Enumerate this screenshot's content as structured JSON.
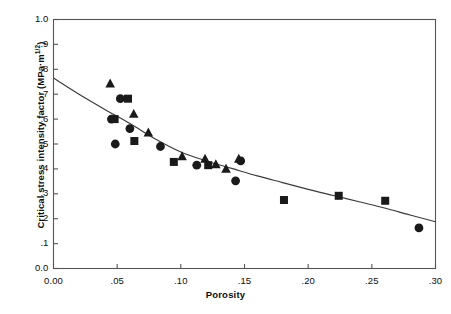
{
  "chart_data": {
    "type": "scatter",
    "title": "",
    "xlabel": "Porosity",
    "ylabel": "Critical stress intensity factor  (MPa·m",
    "ylabel_superscript": "1/2",
    "ylabel_close": ")",
    "xlim": [
      0.0,
      0.3
    ],
    "ylim": [
      0.0,
      1.0
    ],
    "grid": false,
    "legend": "none",
    "xticks": [
      0.0,
      0.05,
      0.1,
      0.15,
      0.2,
      0.25,
      0.3
    ],
    "xtick_labels": [
      "0.00",
      ".05",
      ".10",
      ".15",
      ".20",
      ".25",
      ".30"
    ],
    "yticks": [
      0.0,
      0.1,
      0.2,
      0.3,
      0.4,
      0.5,
      0.6,
      0.7,
      0.8,
      0.9,
      1.0
    ],
    "ytick_labels": [
      "0.0",
      ".1",
      ".2",
      ".3",
      ".4",
      ".5",
      ".6",
      ".7",
      ".8",
      ".9",
      "1.0"
    ],
    "marker_color": "#1a1a1a",
    "curve_color": "#3a3a3a",
    "axis_color": "#555555",
    "series": [
      {
        "name": "circle",
        "marker": "circle",
        "points": [
          {
            "x": 0.0455,
            "y": 0.6
          },
          {
            "x": 0.0525,
            "y": 0.682
          },
          {
            "x": 0.0485,
            "y": 0.5
          },
          {
            "x": 0.06,
            "y": 0.562
          },
          {
            "x": 0.084,
            "y": 0.49
          },
          {
            "x": 0.1125,
            "y": 0.415
          },
          {
            "x": 0.143,
            "y": 0.352
          },
          {
            "x": 0.147,
            "y": 0.432
          },
          {
            "x": 0.287,
            "y": 0.163
          }
        ]
      },
      {
        "name": "square",
        "marker": "square",
        "points": [
          {
            "x": 0.048,
            "y": 0.6
          },
          {
            "x": 0.0585,
            "y": 0.682
          },
          {
            "x": 0.0635,
            "y": 0.512
          },
          {
            "x": 0.0945,
            "y": 0.428
          },
          {
            "x": 0.1215,
            "y": 0.415
          },
          {
            "x": 0.181,
            "y": 0.275
          },
          {
            "x": 0.224,
            "y": 0.292
          },
          {
            "x": 0.2605,
            "y": 0.272
          }
        ]
      },
      {
        "name": "triangle",
        "marker": "triangle",
        "points": [
          {
            "x": 0.0445,
            "y": 0.742
          },
          {
            "x": 0.063,
            "y": 0.62
          },
          {
            "x": 0.0745,
            "y": 0.545
          },
          {
            "x": 0.101,
            "y": 0.45
          },
          {
            "x": 0.119,
            "y": 0.44
          },
          {
            "x": 0.1275,
            "y": 0.418
          },
          {
            "x": 0.1355,
            "y": 0.4
          },
          {
            "x": 0.1455,
            "y": 0.44
          }
        ]
      }
    ],
    "fit_curve": {
      "name": "fitted-trend-curve",
      "points": [
        {
          "x": 0.0,
          "y": 0.765
        },
        {
          "x": 0.02,
          "y": 0.7
        },
        {
          "x": 0.04,
          "y": 0.64
        },
        {
          "x": 0.06,
          "y": 0.582
        },
        {
          "x": 0.08,
          "y": 0.52
        },
        {
          "x": 0.1,
          "y": 0.468
        },
        {
          "x": 0.12,
          "y": 0.432
        },
        {
          "x": 0.14,
          "y": 0.402
        },
        {
          "x": 0.16,
          "y": 0.372
        },
        {
          "x": 0.18,
          "y": 0.345
        },
        {
          "x": 0.2,
          "y": 0.318
        },
        {
          "x": 0.22,
          "y": 0.293
        },
        {
          "x": 0.24,
          "y": 0.268
        },
        {
          "x": 0.26,
          "y": 0.243
        },
        {
          "x": 0.28,
          "y": 0.215
        },
        {
          "x": 0.3,
          "y": 0.188
        }
      ]
    }
  }
}
